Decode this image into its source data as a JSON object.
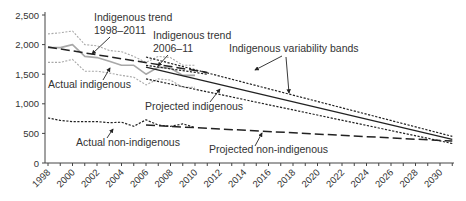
{
  "chart_data": {
    "type": "line",
    "title": "",
    "xlabel": "",
    "ylabel": "",
    "xlim": [
      1998,
      2031
    ],
    "ylim": [
      0,
      2500
    ],
    "grid": false,
    "legend": "none (inline annotations)",
    "y_ticks": [
      "0",
      "500",
      "1,000",
      "1,500",
      "2,000",
      "2,500"
    ],
    "x_ticks": [
      "1998",
      "2000",
      "2002",
      "2004",
      "2006",
      "2008",
      "2010",
      "2012",
      "2014",
      "2016",
      "2018",
      "2020",
      "2022",
      "2024",
      "2026",
      "2028",
      "2030"
    ],
    "series": [
      {
        "name": "Actual indigenous",
        "style": "solid grey",
        "x": [
          1998,
          1999,
          2000,
          2001,
          2002,
          2003,
          2004,
          2005,
          2006,
          2007,
          2008,
          2009,
          2010
        ],
        "values": [
          1950,
          1950,
          2000,
          1800,
          1780,
          1720,
          1650,
          1650,
          1500,
          1620,
          1600,
          1480,
          1480
        ]
      },
      {
        "name": "Indigenous variability band (actual, upper)",
        "style": "dotted grey",
        "x": [
          1998,
          1999,
          2000,
          2001,
          2002,
          2003,
          2004,
          2005,
          2006,
          2007,
          2008,
          2009,
          2010
        ],
        "values": [
          2180,
          2200,
          2230,
          2000,
          1980,
          1900,
          1880,
          1800,
          1700,
          1800,
          1780,
          1650,
          1650
        ]
      },
      {
        "name": "Indigenous variability band (actual, lower)",
        "style": "dotted grey",
        "x": [
          1998,
          1999,
          2000,
          2001,
          2002,
          2003,
          2004,
          2005,
          2006,
          2007,
          2008,
          2009,
          2010
        ],
        "values": [
          1700,
          1700,
          1750,
          1550,
          1550,
          1520,
          1480,
          1450,
          1320,
          1420,
          1400,
          1280,
          1280
        ]
      },
      {
        "name": "Indigenous trend 1998–2011",
        "style": "long dash",
        "x": [
          1998,
          2011
        ],
        "values": [
          1960,
          1530
        ]
      },
      {
        "name": "Indigenous trend 2006–11",
        "style": "dotted dark",
        "x": [
          2006,
          2011
        ],
        "values": [
          1650,
          1500
        ]
      },
      {
        "name": "Projected indigenous",
        "style": "solid dark",
        "x": [
          2006,
          2031
        ],
        "values": [
          1620,
          400
        ]
      },
      {
        "name": "Indigenous variability bands (upper)",
        "style": "dotted dark",
        "x": [
          2006,
          2031
        ],
        "values": [
          1790,
          450
        ]
      },
      {
        "name": "Indigenous variability bands (lower)",
        "style": "dotted dark",
        "x": [
          2006,
          2031
        ],
        "values": [
          1420,
          330
        ]
      },
      {
        "name": "Actual non-indigenous",
        "style": "dotted dark",
        "x": [
          1998,
          1999,
          2000,
          2001,
          2002,
          2003,
          2004,
          2005,
          2006,
          2007,
          2008,
          2009,
          2010
        ],
        "values": [
          760,
          720,
          700,
          700,
          700,
          680,
          690,
          620,
          730,
          640,
          620,
          660,
          600
        ]
      },
      {
        "name": "Projected non-indigenous",
        "style": "long dash",
        "x": [
          2006,
          2031
        ],
        "values": [
          640,
          370
        ]
      }
    ],
    "annotations": [
      {
        "text": "Indigenous trend",
        "text2": "1998–2011"
      },
      {
        "text": "Indigenous trend",
        "text2": "2006–11"
      },
      {
        "text": "Indigenous variability bands"
      },
      {
        "text": "Actual indigenous"
      },
      {
        "text": "Projected indigenous"
      },
      {
        "text": "Actual non-indigenous"
      },
      {
        "text": "Projected non-indigenous"
      }
    ]
  }
}
